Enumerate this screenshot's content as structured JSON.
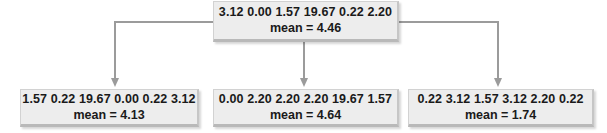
{
  "diagram": {
    "connector_color": "#9b9b9b",
    "box_fill_color": "#ededed",
    "text_color": "#1a1a1a",
    "root": {
      "values_label": "3.12 0.00 1.57 19.67 0.22 2.20",
      "values": [
        3.12,
        0.0,
        1.57,
        19.67,
        0.22,
        2.2
      ],
      "mean_label": "mean = 4.46",
      "mean": 4.46
    },
    "children": [
      {
        "values_label": "1.57 0.22 19.67 0.00 0.22 3.12",
        "values": [
          1.57,
          0.22,
          19.67,
          0.0,
          0.22,
          3.12
        ],
        "mean_label": "mean = 4.13",
        "mean": 4.13
      },
      {
        "values_label": "0.00 2.20 2.20 2.20 19.67 1.57",
        "values": [
          0.0,
          2.2,
          2.2,
          2.2,
          19.67,
          1.57
        ],
        "mean_label": "mean = 4.64",
        "mean": 4.64
      },
      {
        "values_label": "0.22 3.12 1.57 3.12 2.20 0.22",
        "values": [
          0.22,
          3.12,
          1.57,
          3.12,
          2.2,
          0.22
        ],
        "mean_label": "mean = 1.74",
        "mean": 1.74
      }
    ]
  }
}
